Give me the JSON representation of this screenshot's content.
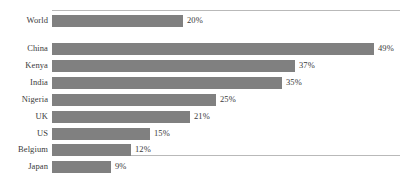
{
  "chart_data": {
    "type": "bar",
    "orientation": "horizontal",
    "title": "",
    "subtitle": "",
    "xlabel": "",
    "ylabel": "",
    "grid": false,
    "legend": null,
    "legend_position": "none",
    "xlim": [
      0,
      53
    ],
    "value_suffix": "%",
    "bar_color": "#808080",
    "frame_color": "#b9b9b9",
    "text_color": "#3a3a3a",
    "categories": [
      "World",
      "China",
      "Kenya",
      "India",
      "Nigeria",
      "UK",
      "US",
      "Belgium",
      "Japan"
    ],
    "values": [
      20,
      49,
      37,
      35,
      25,
      21,
      15,
      12,
      9
    ],
    "value_labels": [
      "20%",
      "49%",
      "37%",
      "35%",
      "25%",
      "21%",
      "15%",
      "12%",
      "9%"
    ],
    "points": [
      {
        "category": "World",
        "value": 20,
        "label": "20%"
      },
      {
        "category": "China",
        "value": 49,
        "label": "49%"
      },
      {
        "category": "Kenya",
        "value": 37,
        "label": "37%"
      },
      {
        "category": "India",
        "value": 35,
        "label": "35%"
      },
      {
        "category": "Nigeria",
        "value": 25,
        "label": "25%"
      },
      {
        "category": "UK",
        "value": 21,
        "label": "21%"
      },
      {
        "category": "US",
        "value": 15,
        "label": "15%"
      },
      {
        "category": "Belgium",
        "value": 12,
        "label": "12%"
      },
      {
        "category": "Japan",
        "value": 9,
        "label": "9%"
      }
    ]
  }
}
